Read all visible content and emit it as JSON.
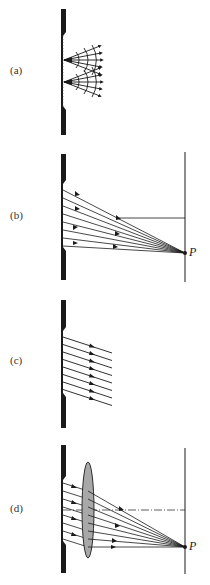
{
  "figure": {
    "panels": [
      {
        "id": "a",
        "label": "(a)",
        "description": "Huygens wavelets from slit"
      },
      {
        "id": "b",
        "label": "(b)",
        "description": "Rays from slit converging to P on distant screen",
        "point_label": "P"
      },
      {
        "id": "c",
        "label": "(c)",
        "description": "Parallel rays leaving slit at an angle"
      },
      {
        "id": "d",
        "label": "(d)",
        "description": "Lens focusing parallel rays to P on screen",
        "point_label": "P"
      }
    ],
    "colors": {
      "ink": "#1a1a1a",
      "lens_fill": "#a8a8a8",
      "background": "#ffffff"
    }
  }
}
